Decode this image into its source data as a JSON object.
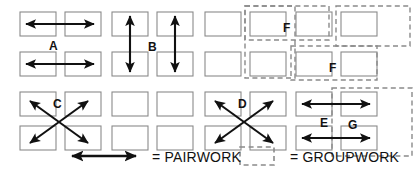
{
  "diagram": {
    "type": "seating-interaction-diagram",
    "colors": {
      "box_stroke": "#8a8a8a",
      "arrow": "#111111",
      "dashed_group": "#8a8a8a",
      "background": "#ffffff",
      "text": "#111111"
    },
    "grid": {
      "columns": 8,
      "rows": 4,
      "box_width": 36,
      "box_height": 24,
      "col_x": [
        20,
        65,
        112,
        157,
        205,
        250,
        296,
        341
      ],
      "row_y": [
        12,
        52,
        92,
        126
      ]
    }
  },
  "boxes": [
    {
      "id": "r0c0",
      "col": 0,
      "row": 0
    },
    {
      "id": "r0c1",
      "col": 1,
      "row": 0
    },
    {
      "id": "r0c2",
      "col": 2,
      "row": 0
    },
    {
      "id": "r0c3",
      "col": 3,
      "row": 0
    },
    {
      "id": "r0c4",
      "col": 4,
      "row": 0
    },
    {
      "id": "r0c5",
      "col": 5,
      "row": 0
    },
    {
      "id": "r0c6",
      "col": 6,
      "row": 0
    },
    {
      "id": "r0c7",
      "col": 7,
      "row": 0
    },
    {
      "id": "r1c0",
      "col": 0,
      "row": 1
    },
    {
      "id": "r1c1",
      "col": 1,
      "row": 1
    },
    {
      "id": "r1c2",
      "col": 2,
      "row": 1
    },
    {
      "id": "r1c3",
      "col": 3,
      "row": 1
    },
    {
      "id": "r1c4",
      "col": 4,
      "row": 1
    },
    {
      "id": "r1c5",
      "col": 5,
      "row": 1
    },
    {
      "id": "r1c6",
      "col": 6,
      "row": 1
    },
    {
      "id": "r1c7",
      "col": 7,
      "row": 1
    },
    {
      "id": "r2c0",
      "col": 0,
      "row": 2
    },
    {
      "id": "r2c1",
      "col": 1,
      "row": 2
    },
    {
      "id": "r2c2",
      "col": 2,
      "row": 2
    },
    {
      "id": "r2c3",
      "col": 3,
      "row": 2
    },
    {
      "id": "r2c4",
      "col": 4,
      "row": 2
    },
    {
      "id": "r2c5",
      "col": 5,
      "row": 2
    },
    {
      "id": "r2c6",
      "col": 6,
      "row": 2
    },
    {
      "id": "r2c7",
      "col": 7,
      "row": 2
    },
    {
      "id": "r3c0",
      "col": 0,
      "row": 3
    },
    {
      "id": "r3c1",
      "col": 1,
      "row": 3
    },
    {
      "id": "r3c2",
      "col": 2,
      "row": 3
    },
    {
      "id": "r3c3",
      "col": 3,
      "row": 3
    },
    {
      "id": "r3c4",
      "col": 4,
      "row": 3
    },
    {
      "id": "r3c5",
      "col": 5,
      "row": 3
    },
    {
      "id": "r3c6",
      "col": 6,
      "row": 3
    },
    {
      "id": "r3c7",
      "col": 7,
      "row": 3
    }
  ],
  "patterns": [
    {
      "label": "A",
      "kind": "pairwork",
      "description": "Horizontal double arrows between adjacent boxes in the same row, for both top rows of columns 1-2.",
      "label_pos": {
        "x": 49,
        "y": 40
      },
      "arrows": [
        {
          "type": "double-horizontal",
          "x1": 26,
          "y1": 24,
          "x2": 94,
          "y2": 24
        },
        {
          "type": "double-horizontal",
          "x1": 26,
          "y1": 64,
          "x2": 94,
          "y2": 64
        }
      ]
    },
    {
      "label": "B",
      "kind": "pairwork",
      "description": "Vertical double arrows between the box above and the box below, in both columns 3-4.",
      "label_pos": {
        "x": 148,
        "y": 41
      },
      "arrows": [
        {
          "type": "double-vertical",
          "x1": 130,
          "y1": 16,
          "x2": 130,
          "y2": 72
        },
        {
          "type": "double-vertical",
          "x1": 175,
          "y1": 16,
          "x2": 175,
          "y2": 72
        }
      ]
    },
    {
      "label": "C",
      "kind": "pairwork",
      "description": "Diagonal cross of double arrows linking the four boxes of a 2x2 block in columns 1-2, rows 3-4.",
      "label_pos": {
        "x": 53,
        "y": 98
      },
      "arrows": [
        {
          "type": "double-diagonal",
          "x1": 30,
          "y1": 101,
          "x2": 88,
          "y2": 143
        },
        {
          "type": "double-diagonal",
          "x1": 88,
          "y1": 101,
          "x2": 30,
          "y2": 143
        }
      ]
    },
    {
      "label": "D",
      "kind": "pairwork",
      "description": "Diagonal cross of double arrows linking the four boxes of a 2x2 block in columns 5-6, rows 3-4.",
      "label_pos": {
        "x": 238,
        "y": 98
      },
      "arrows": [
        {
          "type": "double-diagonal",
          "x1": 215,
          "y1": 101,
          "x2": 273,
          "y2": 143
        },
        {
          "type": "double-diagonal",
          "x1": 273,
          "y1": 101,
          "x2": 215,
          "y2": 143
        }
      ]
    },
    {
      "label": "E",
      "kind": "pairwork",
      "description": "Horizontal double arrows spanning across an aisle between columns 7 and 8, on both bottom rows.",
      "label_pos": {
        "x": 320,
        "y": 117
      },
      "arrows": [
        {
          "type": "double-horizontal",
          "x1": 302,
          "y1": 104,
          "x2": 370,
          "y2": 104
        },
        {
          "type": "double-horizontal",
          "x1": 302,
          "y1": 138,
          "x2": 370,
          "y2": 138
        }
      ]
    },
    {
      "label": "F",
      "kind": "groupwork",
      "description": "Dashed group enclosing column 6 (both top rows) plus the box at column 7 row 1.",
      "label_pos": {
        "x": 283,
        "y": 22
      },
      "groups": [
        {
          "x": 245,
          "y": 6,
          "w": 84,
          "h": 34
        },
        {
          "x": 245,
          "y": 6,
          "w": 50,
          "h": 72
        }
      ]
    },
    {
      "label": "F",
      "kind": "groupwork",
      "description": "Dashed group enclosing column 7 (both top rows) plus column 8 row 2.",
      "label_pos": {
        "x": 329,
        "y": 62
      },
      "groups": [
        {
          "x": 291,
          "y": 46,
          "w": 86,
          "h": 34
        },
        {
          "x": 336,
          "y": 6,
          "w": 74,
          "h": 40
        }
      ]
    },
    {
      "label": "G",
      "kind": "groupwork",
      "description": "Dashed group enclosing the 2x2 block of columns 7-8 on the bottom two rows.",
      "label_pos": {
        "x": 348,
        "y": 119
      },
      "groups": [
        {
          "x": 332,
          "y": 88,
          "w": 80,
          "h": 68
        }
      ]
    }
  ],
  "legend": {
    "items": [
      {
        "symbol": "double-headed-arrow",
        "equals": "=",
        "label": "PAIRWORK",
        "symbol_box": {
          "x": 72,
          "y": 156,
          "w": 64,
          "h": 2
        },
        "text_x": 152,
        "text_y": 150
      },
      {
        "symbol": "dashed-rectangle",
        "equals": "=",
        "label": "GROUPWORK",
        "symbol_box": {
          "x": 240,
          "y": 147,
          "w": 34,
          "h": 18
        },
        "text_x": 290,
        "text_y": 150
      }
    ]
  }
}
